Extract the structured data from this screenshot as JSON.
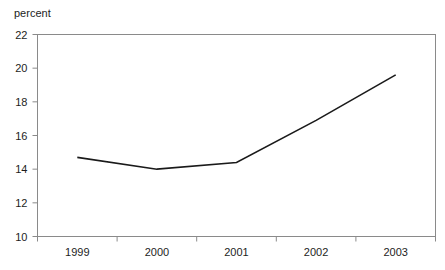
{
  "chart_data": {
    "type": "line",
    "title": "",
    "subtitle": "",
    "xlabel": "",
    "ylabel": "percent",
    "categories": [
      "1999",
      "2000",
      "2001",
      "2002",
      "2003"
    ],
    "values": [
      14.7,
      14.0,
      14.4,
      16.9,
      19.6
    ],
    "series": [
      {
        "name": "percent",
        "values": [
          14.7,
          14.0,
          14.4,
          16.9,
          19.6
        ]
      }
    ],
    "ylim": [
      10,
      22
    ],
    "yticks": [
      10,
      12,
      14,
      16,
      18,
      20,
      22
    ],
    "ytick_labels": [
      "10",
      "12",
      "14",
      "16",
      "18",
      "20",
      "22"
    ],
    "xtick_labels": [
      "1999",
      "2000",
      "2001",
      "2002",
      "2003"
    ],
    "grid": false,
    "legend": false,
    "legend_position": "none",
    "annotations": [],
    "line_color": "#1a1a1a",
    "frame_color": "#8a8a8a",
    "background_color": "#ffffff"
  },
  "axis": {
    "unit_label": "percent"
  }
}
